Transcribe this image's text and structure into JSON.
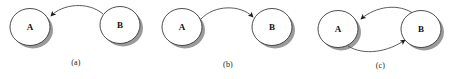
{
  "figure": {
    "background_color": "#ffffff",
    "node_stroke_color": "#3a3a3a",
    "node_fill_color": "#ffffff",
    "node_shadow_color": "#9a9a9a",
    "edge_color": "#4a4a4a",
    "label_color": "#111111",
    "caption_color": "#1a1a1a"
  },
  "panels": [
    {
      "id": "a",
      "caption": "(a)",
      "nodes": [
        {
          "id": "A",
          "label": "A",
          "cx": 30,
          "cy": 27,
          "r": 20
        },
        {
          "id": "B",
          "label": "B",
          "cx": 120,
          "cy": 25,
          "r": 20
        }
      ],
      "edges": [
        {
          "from": "B",
          "to": "A",
          "direction": "B-to-A",
          "curve": "arc-above",
          "arrowhead_at": "A"
        }
      ]
    },
    {
      "id": "b",
      "caption": "(b)",
      "nodes": [
        {
          "id": "A",
          "label": "A",
          "cx": 30,
          "cy": 27,
          "r": 20
        },
        {
          "id": "B",
          "label": "B",
          "cx": 120,
          "cy": 27,
          "r": 20
        }
      ],
      "edges": [
        {
          "from": "A",
          "to": "B",
          "direction": "A-to-B",
          "curve": "arc-above",
          "arrowhead_at": "B"
        }
      ]
    },
    {
      "id": "c",
      "caption": "(c)",
      "nodes": [
        {
          "id": "A",
          "label": "A",
          "cx": 34,
          "cy": 29,
          "r": 20
        },
        {
          "id": "B",
          "label": "B",
          "cx": 117,
          "cy": 29,
          "r": 20
        }
      ],
      "edges": [
        {
          "from": "B",
          "to": "A",
          "direction": "B-to-A",
          "curve": "arc-above",
          "arrowhead_at": "A"
        },
        {
          "from": "A",
          "to": "B",
          "direction": "A-to-B",
          "curve": "arc-below",
          "arrowhead_at": "B"
        }
      ]
    }
  ]
}
